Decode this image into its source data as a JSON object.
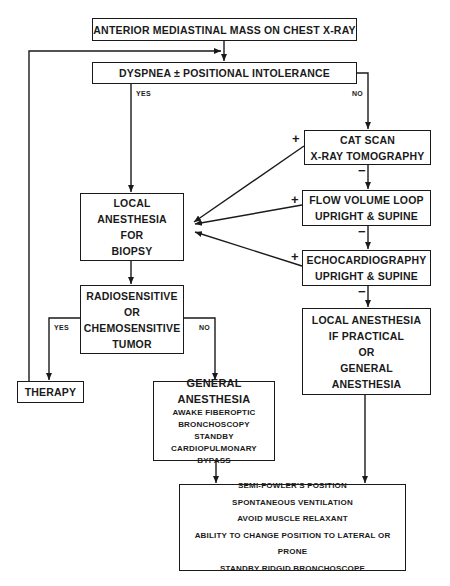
{
  "diagram": {
    "nodes": {
      "start": {
        "label": "ANTERIOR MEDIASTINAL MASS ON CHEST X-RAY"
      },
      "dyspnea": {
        "label": "DYSPNEA ± POSITIONAL INTOLERANCE"
      },
      "cat_scan": {
        "lines": [
          "CAT SCAN",
          "X-RAY TOMOGRAPHY"
        ]
      },
      "flow_volume": {
        "lines": [
          "FLOW VOLUME LOOP",
          "UPRIGHT & SUPINE"
        ]
      },
      "echo": {
        "lines": [
          "ECHOCARDIOGRAPHY",
          "UPRIGHT & SUPINE"
        ]
      },
      "local_if_practical": {
        "lines": [
          "LOCAL ANESTHESIA",
          "IF PRACTICAL",
          "OR",
          "GENERAL",
          "ANESTHESIA"
        ]
      },
      "local_biopsy": {
        "lines": [
          "LOCAL",
          "ANESTHESIA",
          "FOR",
          "BIOPSY"
        ]
      },
      "radiosensitive": {
        "lines": [
          "RADIOSENSITIVE",
          "OR",
          "CHEMOSENSITIVE",
          "TUMOR"
        ]
      },
      "therapy": {
        "label": "THERAPY"
      },
      "general_anesthesia": {
        "title": "GENERAL ANESTHESIA",
        "lines": [
          "AWAKE FIBEROPTIC",
          "BRONCHOSCOPY",
          "STANDBY",
          "CARDIOPULMONARY BYPASS"
        ]
      },
      "precautions": {
        "lines": [
          "SEMI-FOWLER'S POSITION",
          "SPONTANEOUS VENTILATION",
          "AVOID MUSCLE RELAXANT",
          "ABILITY TO CHANGE POSITION TO LATERAL OR PRONE",
          "STANDBY RIDGID BRONCHOSCOPE"
        ]
      }
    },
    "edge_labels": {
      "dyspnea_yes": "YES",
      "dyspnea_no": "NO",
      "tumor_yes": "YES",
      "tumor_no": "NO",
      "cat_plus": "+",
      "cat_minus": "−",
      "flow_plus": "+",
      "flow_minus": "−",
      "echo_plus": "+",
      "echo_minus": "−"
    },
    "colors": {
      "ink": "#1a1a1a",
      "background": "#ffffff"
    }
  }
}
